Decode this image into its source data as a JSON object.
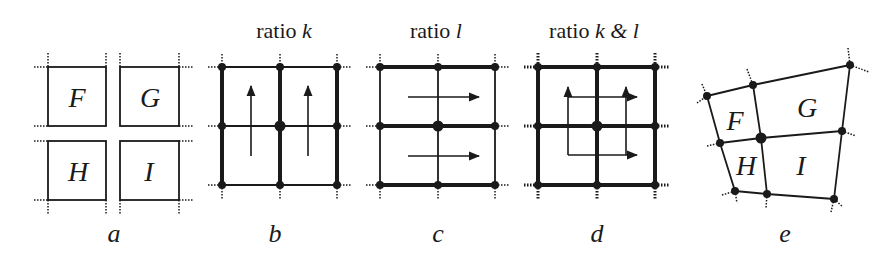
{
  "figure": {
    "panels": [
      {
        "id": "a",
        "caption": "a",
        "title": "",
        "cells": [
          "F",
          "G",
          "H",
          "I"
        ]
      },
      {
        "id": "b",
        "caption": "b",
        "title_prefix": "ratio ",
        "title_var": "k",
        "arrows": "vertical"
      },
      {
        "id": "c",
        "caption": "c",
        "title_prefix": "ratio ",
        "title_var": "l",
        "arrows": "horizontal"
      },
      {
        "id": "d",
        "caption": "d",
        "title_prefix": "ratio ",
        "title_var": "k & l",
        "arrows": "both"
      },
      {
        "id": "e",
        "caption": "e",
        "title": "",
        "cells": [
          "F",
          "G",
          "H",
          "I"
        ]
      }
    ]
  }
}
